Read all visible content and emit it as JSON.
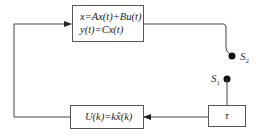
{
  "diagram": {
    "plant_box": {
      "line1": "x=Ax(t)+Bu(t)",
      "line2": "y(t)=Cx(t)"
    },
    "controller_box": {
      "label": "U(k)=kx̃(k)"
    },
    "delay_box": {
      "label": "τ"
    },
    "switches": {
      "s2": {
        "name": "S",
        "sub": "2"
      },
      "s1": {
        "name": "S",
        "sub": "1"
      }
    },
    "colors": {
      "line": "#444444",
      "dot": "#111111"
    }
  }
}
